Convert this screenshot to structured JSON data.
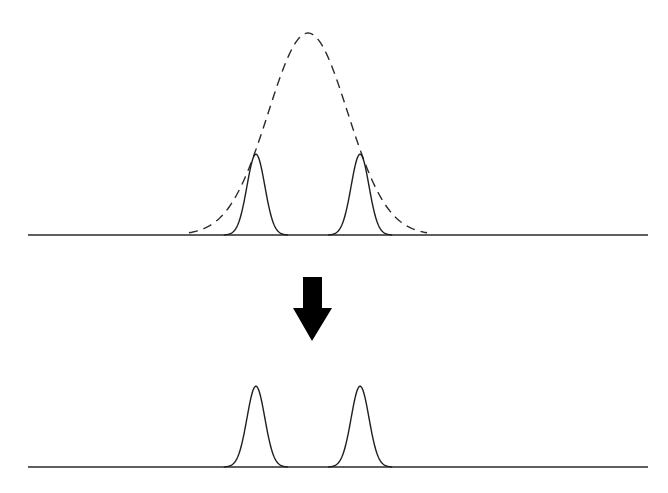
{
  "diagram": {
    "title": "",
    "colors": {
      "line": "#1e1e1e",
      "arrow": "#000000",
      "background": "#ffffff"
    },
    "panels": [
      {
        "name": "before",
        "envelope": {
          "style": "dashed",
          "center": 0.5,
          "width": 0.2,
          "height": 1.0
        },
        "peaks": [
          {
            "center": 0.395,
            "width": 0.045,
            "height": 0.4
          },
          {
            "center": 0.605,
            "width": 0.045,
            "height": 0.4
          }
        ]
      },
      {
        "name": "after",
        "envelope": null,
        "peaks": [
          {
            "center": 0.395,
            "width": 0.045,
            "height": 0.4
          },
          {
            "center": 0.605,
            "width": 0.045,
            "height": 0.4
          }
        ]
      }
    ],
    "arrow": {
      "direction": "down",
      "icon": "down-arrow-icon"
    }
  }
}
